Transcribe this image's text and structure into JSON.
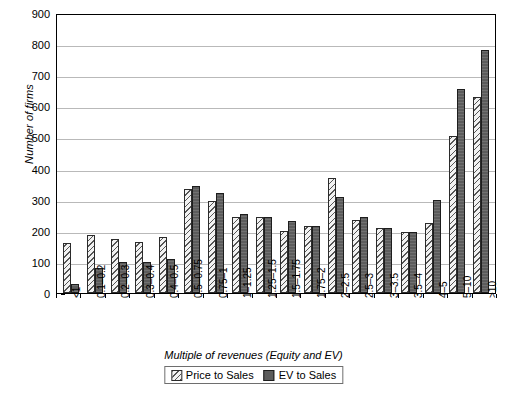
{
  "chart_data": {
    "type": "bar",
    "title": "",
    "xlabel": "Multiple of revenues (Equity and EV)",
    "ylabel": "Number of firms",
    "ylim": [
      0,
      900
    ],
    "ytick_step": 100,
    "yticks": [
      "900",
      "800",
      "700",
      "600",
      "500",
      "400",
      "300",
      "200",
      "100",
      "0"
    ],
    "grid": "horizontal",
    "legend_position": "bottom-center",
    "categories": [
      "<1",
      "0.1–0.2",
      "0.2–0.3",
      "0.3–0.4",
      "0.4–0.5",
      "0.5–0.75",
      "0.75–1",
      "1–1.25",
      "1.25–1.5",
      "1.5–1.75",
      "1.75–2",
      "2–2.5",
      "2.5–3",
      "3–3.5",
      "3.5–4",
      "4–5",
      "5–10",
      ">10"
    ],
    "series": [
      {
        "name": "Price to Sales",
        "color": "#f2f2f2",
        "pattern": "diagonal-hatch",
        "values": [
          160,
          185,
          175,
          165,
          180,
          335,
          295,
          245,
          245,
          200,
          215,
          370,
          235,
          210,
          195,
          225,
          505,
          630
        ]
      },
      {
        "name": "EV to Sales",
        "color": "#5c5c5c",
        "pattern": "solid-dark",
        "values": [
          30,
          80,
          100,
          100,
          110,
          345,
          320,
          255,
          245,
          230,
          215,
          310,
          245,
          210,
          195,
          298,
          655,
          780
        ]
      }
    ]
  },
  "legend": {
    "items": [
      {
        "label": "Price to Sales"
      },
      {
        "label": "EV to Sales"
      }
    ]
  }
}
